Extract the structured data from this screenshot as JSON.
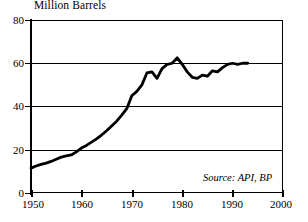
{
  "chart_data": {
    "type": "line",
    "title": "",
    "ylabel": "Million Barrels",
    "xlabel": "",
    "xlim": [
      1950,
      2000
    ],
    "ylim": [
      0,
      80
    ],
    "grid": true,
    "legend": false,
    "yticks": [
      0,
      20,
      40,
      60,
      80
    ],
    "ytick_labels": [
      "0",
      "20",
      "40",
      "60",
      "80"
    ],
    "xticks": [
      1950,
      1960,
      1970,
      1980,
      1990,
      2000
    ],
    "xtick_labels": [
      "1950",
      "1960",
      "1970",
      "1980",
      "1990",
      "2000"
    ],
    "annotations": [
      {
        "name": "source-note",
        "text": "Source: API, BP"
      }
    ],
    "series": [
      {
        "name": "World Oil Production",
        "x": [
          1950,
          1951,
          1952,
          1953,
          1954,
          1955,
          1956,
          1957,
          1958,
          1959,
          1960,
          1961,
          1962,
          1963,
          1964,
          1965,
          1966,
          1967,
          1968,
          1969,
          1970,
          1971,
          1972,
          1973,
          1974,
          1975,
          1976,
          1977,
          1978,
          1979,
          1980,
          1981,
          1982,
          1983,
          1984,
          1985,
          1986,
          1987,
          1988,
          1989,
          1990,
          1991,
          1992,
          1993
        ],
        "values": [
          11.5,
          12.5,
          13.2,
          13.8,
          14.6,
          15.6,
          16.6,
          17.2,
          17.6,
          19.0,
          20.8,
          22.0,
          23.5,
          25.0,
          26.8,
          28.8,
          31.0,
          33.2,
          36.0,
          39.0,
          45.0,
          47.0,
          50.0,
          55.5,
          56.0,
          53.0,
          57.5,
          59.5,
          60.0,
          62.5,
          59.5,
          56.0,
          53.5,
          53.0,
          54.5,
          54.0,
          56.5,
          56.0,
          58.0,
          59.5,
          60.0,
          59.5,
          60.0,
          60.0
        ]
      }
    ]
  }
}
